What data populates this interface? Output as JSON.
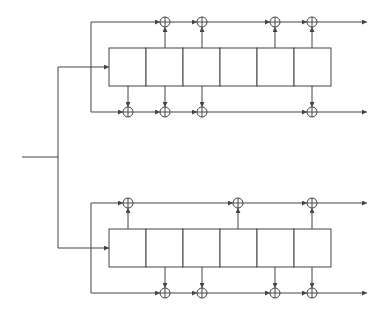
{
  "diagram": {
    "type": "parallel convolutional encoder (shift registers with XOR taps)",
    "stroke_color": "#444444",
    "background": "#ffffff",
    "input": {
      "x1": 22,
      "x2": 58,
      "y": 157
    },
    "splitter": {
      "x": 58,
      "y_top": 67,
      "y_bottom": 248
    },
    "cell_width": 37,
    "cells_per_register": 6,
    "register_x": 109,
    "output_end_x": 367,
    "encoders": [
      {
        "name": "encoder-1",
        "box_top": 48,
        "box_bottom": 86,
        "input_y": 67,
        "loop_x": 91,
        "top_line_y": 22,
        "bottom_line_y": 112,
        "top_xor_x": [
          165,
          202,
          275,
          312
        ],
        "bottom_xor_x": [
          128,
          165,
          202,
          312
        ]
      },
      {
        "name": "encoder-2",
        "box_top": 229,
        "box_bottom": 267,
        "input_y": 248,
        "loop_x": 91,
        "top_line_y": 203,
        "bottom_line_y": 293,
        "top_xor_x": [
          128,
          238,
          312
        ],
        "bottom_xor_x": [
          165,
          202,
          275,
          312
        ]
      }
    ]
  }
}
